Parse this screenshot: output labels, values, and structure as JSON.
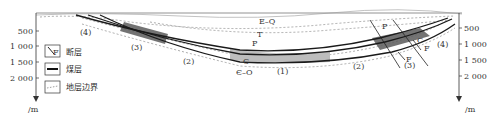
{
  "diagram": {
    "type": "geological-cross-section",
    "left_axis": {
      "ticks": [
        "500",
        "1 000",
        "1 500",
        "2 000"
      ],
      "unit": "/m"
    },
    "right_axis": {
      "ticks": [
        "500",
        "1 000",
        "1 500",
        "2 000"
      ],
      "unit": "/m"
    },
    "strata_labels": {
      "eq": "E–Q",
      "t": "T",
      "p_center": "P",
      "c_center": "C",
      "eo": "Є–O",
      "p_right": "P",
      "c_right": "C"
    },
    "zone_labels": {
      "z4_left": "(4)",
      "z3_left": "(3)",
      "z2_left": "(2)",
      "z1": "(1)",
      "z2_right": "(2)",
      "z3_right": "(3)",
      "z4_right": "(4)"
    },
    "fault_labels": [
      "F",
      "F",
      "F"
    ],
    "legend": {
      "fault_symbol": "F",
      "items": [
        {
          "icon": "fault-icon",
          "label": "断层"
        },
        {
          "icon": "coal-seam-icon",
          "label": "煤层"
        },
        {
          "icon": "stratum-boundary-icon",
          "label": "地层边界"
        }
      ]
    },
    "colors": {
      "coal_seam": "#1a1a1a",
      "shaded_zone_dark": "#555555",
      "shaded_zone_light": "#b5b5b5",
      "boundary": "#888888"
    }
  }
}
